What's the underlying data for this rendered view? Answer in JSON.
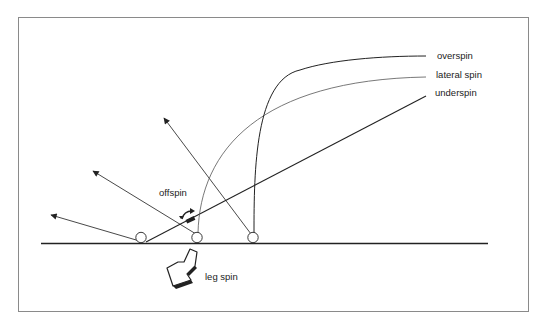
{
  "diagram": {
    "labels": {
      "overspin": "overspin",
      "lateral_spin": "lateral spin",
      "underspin": "underspin",
      "offspin": "offspin",
      "leg_spin": "leg spin"
    },
    "colors": {
      "line": "#222222",
      "frame": "#8a8a8a",
      "background": "#ffffff"
    },
    "elements": {
      "ground_line": "horizontal surface",
      "balls": [
        "ball-left",
        "ball-middle",
        "ball-right"
      ],
      "rebound_arrows": [
        "low-angle arrow",
        "mid-angle arrow",
        "high-angle arrow"
      ],
      "trajectories": [
        "overspin curve",
        "lateral spin curve",
        "underspin straight line"
      ],
      "spin_icons": [
        "offspin curved arrow",
        "leg spin 3D arrow"
      ]
    }
  }
}
